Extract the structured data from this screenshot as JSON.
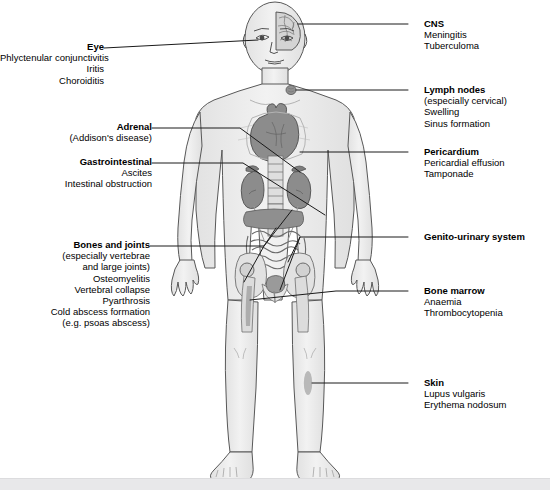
{
  "diagram": {
    "figure_alt": "Anterior view of a human body with internal organs shown",
    "colors": {
      "leader_line": "#1a1a1a",
      "body_fill": "#ededed",
      "body_outline": "#585858",
      "organ_fill": "#8c8c8c",
      "organ_dark": "#7a7a7a",
      "bone_fill": "#dcdcdc",
      "ground_band": "#e8e8ea",
      "text": "#000000"
    }
  },
  "labels_left": [
    {
      "id": "eye",
      "heading": "Eye",
      "lines": [
        "Phlyctenular conjunctivitis",
        "Iritis",
        "Choroiditis"
      ]
    },
    {
      "id": "adrenal",
      "heading": "Adrenal",
      "lines": [
        "(Addison's disease)"
      ]
    },
    {
      "id": "gastrointestinal",
      "heading": "Gastrointestinal",
      "lines": [
        "Ascites",
        "Intestinal obstruction"
      ]
    },
    {
      "id": "bones-and-joints",
      "heading": "Bones and joints",
      "lines": [
        "(especially vertebrae",
        "and large joints)",
        "Osteomyelitis",
        "Vertebral collapse",
        "Pyarthrosis",
        "Cold abscess formation",
        "(e.g. psoas abscess)"
      ]
    }
  ],
  "labels_right": [
    {
      "id": "cns",
      "heading": "CNS",
      "lines": [
        "Meningitis",
        "Tuberculoma"
      ]
    },
    {
      "id": "lymph-nodes",
      "heading": "Lymph nodes",
      "lines": [
        "(especially cervical)",
        "Swelling",
        "Sinus formation"
      ]
    },
    {
      "id": "pericardium",
      "heading": "Pericardium",
      "lines": [
        "Pericardial effusion",
        "Tamponade"
      ]
    },
    {
      "id": "genito-urinary-system",
      "heading": "Genito-urinary system",
      "lines": []
    },
    {
      "id": "bone-marrow",
      "heading": "Bone marrow",
      "lines": [
        "Anaemia",
        "Thrombocytopenia"
      ]
    },
    {
      "id": "skin",
      "heading": "Skin",
      "lines": [
        "Lupus vulgaris",
        "Erythema nodosum"
      ]
    }
  ]
}
